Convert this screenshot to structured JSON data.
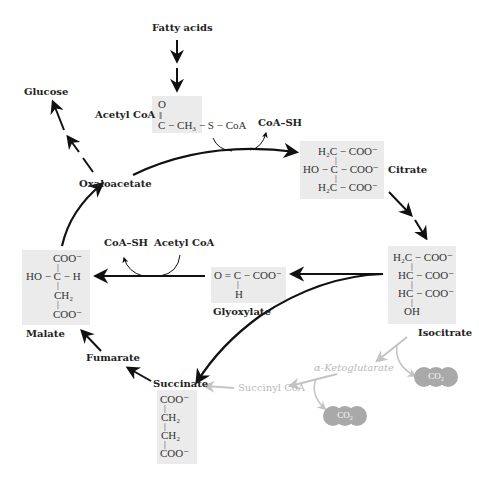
{
  "labels": {
    "fatty_acids": "Fatty acids",
    "glucose": "Glucose",
    "acetyl_coa_top": "Acetyl CoA",
    "coa_sh_top": "CoA–SH",
    "citrate": "Citrate",
    "oxaloacetate": "Oxaloacetate",
    "coa_sh_mid": "CoA–SH",
    "acetyl_coa_mid": "Acetyl CoA",
    "malate": "Malate",
    "glyoxylate": "Glyoxylate",
    "isocitrate": "Isocitrate",
    "fumarate": "Fumarate",
    "succinate": "Succinate",
    "succinyl_coa": "Succinyl CoA",
    "alpha_ketoglutarate": "α-Ketoglutarate",
    "co2_1": "CO₂",
    "co2_2": "CO₂"
  },
  "structures": {
    "acetyl_coa": {
      "o": "O",
      "dbl": "‖",
      "main": "C − CH₃ − S − CoA"
    },
    "citrate": {
      "l1": "H₂C − COO⁻",
      "b1": "|",
      "l2": "HO − C − COO⁻",
      "b2": "|",
      "l3": "H₂C − COO⁻"
    },
    "isocitrate": {
      "l1": "H₂C − COO⁻",
      "b1": "|",
      "l2": "HC − COO⁻",
      "b2": "|",
      "l3": "HC − COO⁻",
      "b3": "|",
      "l4": "OH"
    },
    "glyoxylate": {
      "l1": "O = C − COO⁻",
      "b1": "|",
      "l2": "H"
    },
    "malate": {
      "l1": "COO⁻",
      "b1": "|",
      "l2": "HO − C − H",
      "b2": "|",
      "l3": "CH₂",
      "b3": "|",
      "l4": "COO⁻"
    },
    "succinate": {
      "l1": "COO⁻",
      "b1": "|",
      "l2": "CH₂",
      "b2": "|",
      "l3": "CH₂",
      "b3": "|",
      "l4": "COO⁻"
    }
  },
  "colors": {
    "arrow": "#111111",
    "faded": "#c4c4c4",
    "box": "#ebebeb",
    "co2_fill": "#a9a9a9"
  }
}
